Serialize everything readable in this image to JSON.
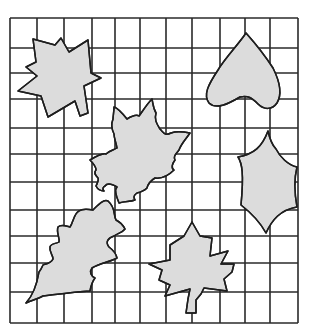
{
  "figure": {
    "grid": {
      "columns": 11,
      "rows": 11,
      "x_lines": [
        10,
        37,
        64,
        92,
        115,
        140,
        166,
        192,
        220,
        245,
        270,
        298
      ],
      "y_lines": [
        18,
        48,
        73,
        99,
        128,
        154,
        182,
        210,
        236,
        263,
        292,
        323
      ],
      "line_color": "#2a2a2a"
    },
    "fill_color": "#dcdcdc",
    "stroke_color": "#1e1e1e",
    "leaves": [
      {
        "name": "maple-leaf-top-left",
        "type": "maple",
        "path": "M33,39 L55,45 L61,38 L69,52 L88,40 L91,73 L101,78 L84,86 L88,113 L80,116 L75,101 L48,117 L41,96 L18,91 L37,76 L26,67 L36,62 Z"
      },
      {
        "name": "heart-leaf-top-right",
        "type": "heart",
        "path": "M246,33 C238,45 225,58 218,70 C208,85 203,95 209,103 C216,110 228,104 240,97 C248,95 252,98 258,104 C264,110 272,110 277,103 C283,93 279,80 273,68 C264,54 254,42 246,33 Z"
      },
      {
        "name": "maple-leaf-center",
        "type": "maple",
        "path": "M114,107 C118,108 123,114 127,119 C132,116 136,114 139,116 C142,112 147,104 152,99 C153,103 153,108 156,113 C154,120 157,124 160,129 C164,133 165,136 171,133 C176,131 180,131 190,133 C186,139 181,144 179,150 C176,154 173,156 175,160 C172,164 171,168 174,170 C170,174 163,179 155,178 C150,181 148,184 147,188 C144,191 141,192 137,193 C134,195 133,197 135,200 C130,202 125,201 119,203 C116,196 114,190 117,187 C112,184 107,183 105,186 C103,187 102,189 104,191 C100,191 97,188 96,186 C98,182 99,180 98,178 C95,175 94,172 96,170 C96,167 94,164 90,160 C95,157 102,153 106,154 C110,150 114,150 117,148 C116,142 114,138 114,134 C112,130 111,124 113,119 C113,116 114,112 114,107 Z"
      },
      {
        "name": "holly-leaf-right",
        "type": "holly",
        "path": "M268,131 C262,147 254,154 238,157 C242,163 244,173 241,205 C250,212 260,222 266,233 C272,220 280,210 297,207 C295,196 293,183 297,167 C288,165 280,157 276,149 C272,145 270,140 268,131 Z"
      },
      {
        "name": "oak-leaf-bottom-left",
        "type": "oak",
        "path": "M26,303 C32,300 38,299 43,296 C60,294 75,292 90,291 C91,285 92,282 95,278 C91,276 89,272 92,268 C100,263 110,262 117,258 C116,253 113,250 109,247 C105,242 108,238 114,236 C118,233 122,233 125,229 C123,225 120,222 116,220 C113,214 116,208 108,201 C103,199 98,205 93,210 C88,209 83,208 79,211 C74,213 73,223 70,227 C66,226 61,224 58,227 C56,232 60,238 59,242 C56,244 51,243 50,247 C49,252 53,255 53,259 C51,264 44,264 43,265 C42,267 41,270 39,272 C37,284 34,294 26,303 Z"
      },
      {
        "name": "maple-leaf-bottom-center",
        "type": "maple",
        "path": "M192,222 L200,236 L212,238 L210,256 L228,251 L221,264 L234,264 L232,272 L224,279 L227,291 L204,288 L201,294 L196,300 L196,313 L186,313 L188,299 L190,289 L165,296 L170,285 L159,280 L162,270 L149,264 L170,260 L170,245 L184,236 Z"
      }
    ]
  }
}
